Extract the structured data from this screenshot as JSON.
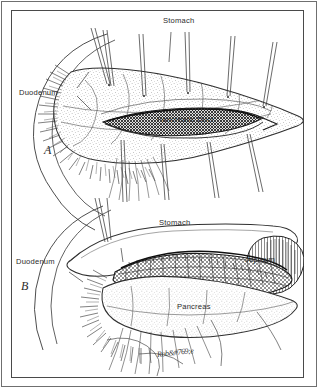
{
  "figure": {
    "style": "pen-and-ink medical line drawing",
    "background_color": "#ffffff",
    "ink_color": "#2b2b2b",
    "frame": {
      "outer_rule_color": "#6f6f6f",
      "inner_frame_color": "#4a4a4a"
    }
  },
  "panels": [
    {
      "letter": "A",
      "description": "Pancreas opened longitudinally along the pancreatic duct with stay sutures; duodenum outlined behind",
      "labels": [
        {
          "text": "Stomach",
          "x": 163,
          "y": 17
        },
        {
          "text": "Duodenum",
          "x": 19,
          "y": 89
        },
        {
          "text": "Pancreatic Duct",
          "x": 157,
          "y": 116
        }
      ]
    },
    {
      "letter": "B",
      "description": "Completed side-to-side pancreaticojejunostomy with jejunal loop sewn to the opened pancreatic duct",
      "labels": [
        {
          "text": "Stomach",
          "x": 159,
          "y": 219
        },
        {
          "text": "Duodenum",
          "x": 16,
          "y": 258
        },
        {
          "text": "Jejunum",
          "x": 245,
          "y": 256
        },
        {
          "text": "Pancreas",
          "x": 177,
          "y": 303
        }
      ]
    }
  ],
  "panel_letters": [
    {
      "text": "A",
      "x": 44,
      "y": 145
    },
    {
      "text": "B",
      "x": 21,
      "y": 281
    }
  ],
  "signature": {
    "text": "Rob&#769;e",
    "x": 157,
    "y": 349
  }
}
